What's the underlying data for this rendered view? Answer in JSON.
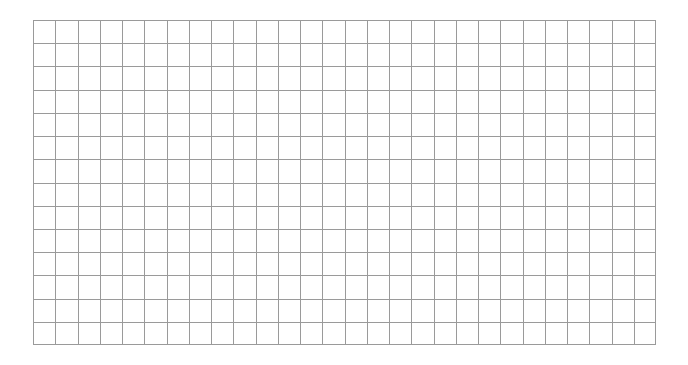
{
  "grid": {
    "columns": 28,
    "rows": 14,
    "line_color": "#9a9a9a",
    "background": "#ffffff"
  }
}
